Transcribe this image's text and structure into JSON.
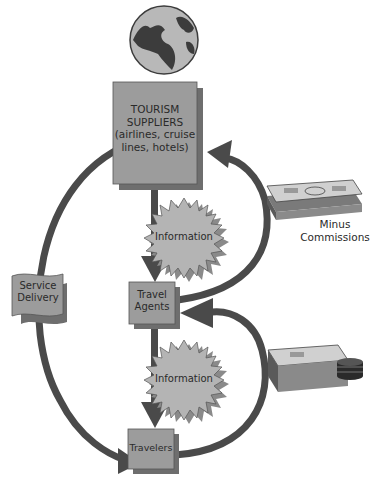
{
  "diagram": {
    "nodes": {
      "suppliers": {
        "line1": "TOURISM",
        "line2": "SUPPLIERS",
        "line3": "(airlines, cruise",
        "line4": "lines, hotels)"
      },
      "agents": {
        "line1": "Travel",
        "line2": "Agents"
      },
      "travelers": {
        "label": "Travelers"
      },
      "service": {
        "line1": "Service",
        "line2": "Delivery"
      }
    },
    "bursts": {
      "top": "Information",
      "bottom": "Information"
    },
    "money_labels": {
      "top_line1": "Minus",
      "top_line2": "Commissions"
    },
    "icons": [
      "globe-icon",
      "money-stack-icon",
      "money-coins-icon"
    ],
    "colors": {
      "box_fill": "#9c9c9c",
      "box_shadow": "#6e6e6e",
      "arrow": "#4a4a4a",
      "burst_fill": "#b4b4b4",
      "globe_sea": "#b8b8b8",
      "globe_land": "#3c3c3c"
    }
  }
}
